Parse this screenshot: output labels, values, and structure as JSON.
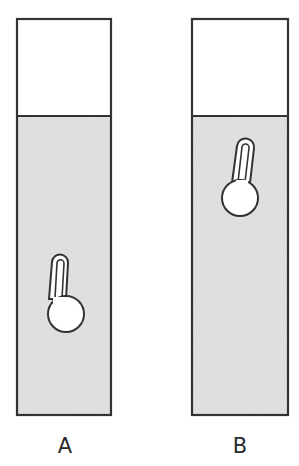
{
  "figure": {
    "colors": {
      "outline": "#333333",
      "liquid": "#dcdcdc",
      "air": "#ffffff",
      "thermometer_fill": "#ffffff"
    },
    "containers": [
      {
        "label": "A",
        "x": 17,
        "y": 19,
        "width": 94,
        "height": 396,
        "liquid_top_y": 116,
        "thermometer": {
          "position": "low",
          "bulb_cx": 66,
          "bulb_cy": 314,
          "bulb_r": 18,
          "tube_top_cx": 60,
          "tube_top_y": 254
        }
      },
      {
        "label": "B",
        "x": 192,
        "y": 19,
        "width": 96,
        "height": 396,
        "liquid_top_y": 116,
        "thermometer": {
          "position": "high",
          "bulb_cx": 240,
          "bulb_cy": 198,
          "bulb_r": 18,
          "tube_top_cx": 246,
          "tube_top_y": 138
        }
      }
    ]
  }
}
